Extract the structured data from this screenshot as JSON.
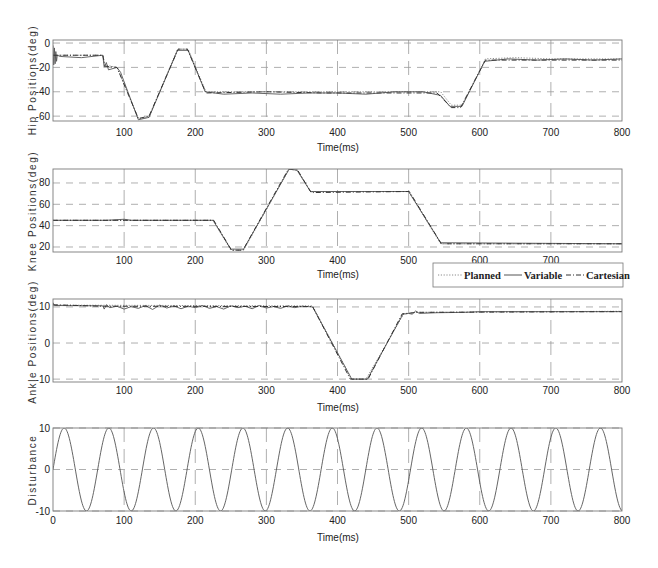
{
  "legend": {
    "entries": [
      {
        "label": "Planned",
        "color": "#8a8a8a",
        "style": "dotted"
      },
      {
        "label": "Variable",
        "color": "#555555",
        "style": "solid"
      },
      {
        "label": "Cartesian",
        "color": "#333333",
        "style": "dashdot"
      }
    ]
  },
  "chart_data": [
    {
      "type": "line",
      "title": "",
      "xlabel": "Time(ms)",
      "ylabel": "Hip Positions(deg)",
      "xlim": [
        0,
        800
      ],
      "ylim": [
        -64,
        2.5
      ],
      "grid": true,
      "xticks": [
        0,
        100,
        200,
        300,
        400,
        500,
        600,
        700,
        800
      ],
      "xtick_labels": [
        "",
        "100",
        "200",
        "300",
        "400",
        "500",
        "600",
        "700",
        "800"
      ],
      "yticks": [
        0,
        -20,
        -40,
        -60
      ],
      "ytick_labels": [
        "0",
        "-20",
        "-40",
        "-60"
      ],
      "series": [
        {
          "name": "Planned",
          "points": [
            [
              0,
              -10
            ],
            [
              70,
              -10
            ],
            [
              73,
              -18
            ],
            [
              90,
              -20
            ],
            [
              120,
              -62
            ],
            [
              135,
              -61
            ],
            [
              175,
              -5
            ],
            [
              190,
              -5
            ],
            [
              215,
              -40
            ],
            [
              545,
              -40
            ],
            [
              560,
              -51
            ],
            [
              575,
              -51
            ],
            [
              608,
              -13
            ],
            [
              650,
              -12
            ],
            [
              700,
              -13
            ],
            [
              800,
              -13
            ]
          ]
        },
        {
          "name": "Variable",
          "points": [
            [
              0,
              -2
            ],
            [
              1,
              -18
            ],
            [
              2,
              -4
            ],
            [
              3,
              -17
            ],
            [
              4,
              -7
            ],
            [
              5,
              -15
            ],
            [
              6,
              -10
            ],
            [
              10,
              -11
            ],
            [
              40,
              -12
            ],
            [
              70,
              -10
            ],
            [
              72,
              -20
            ],
            [
              75,
              -16
            ],
            [
              78,
              -22
            ],
            [
              90,
              -20
            ],
            [
              95,
              -24
            ],
            [
              120,
              -63
            ],
            [
              135,
              -61
            ],
            [
              175,
              -6
            ],
            [
              190,
              -6
            ],
            [
              214,
              -40
            ],
            [
              240,
              -42
            ],
            [
              280,
              -41
            ],
            [
              320,
              -42
            ],
            [
              360,
              -41
            ],
            [
              400,
              -41
            ],
            [
              440,
              -42
            ],
            [
              480,
              -40
            ],
            [
              520,
              -40
            ],
            [
              545,
              -43
            ],
            [
              558,
              -52
            ],
            [
              575,
              -52
            ],
            [
              607,
              -15
            ],
            [
              640,
              -13
            ],
            [
              680,
              -14
            ],
            [
              720,
              -13
            ],
            [
              760,
              -14
            ],
            [
              800,
              -13
            ]
          ]
        },
        {
          "name": "Cartesian",
          "points": [
            [
              0,
              -10
            ],
            [
              70,
              -10
            ],
            [
              73,
              -19
            ],
            [
              90,
              -20
            ],
            [
              120,
              -62
            ],
            [
              135,
              -60
            ],
            [
              176,
              -5
            ],
            [
              189,
              -5
            ],
            [
              215,
              -41
            ],
            [
              300,
              -40
            ],
            [
              380,
              -41
            ],
            [
              460,
              -41
            ],
            [
              540,
              -41
            ],
            [
              560,
              -53
            ],
            [
              573,
              -53
            ],
            [
              608,
              -14
            ],
            [
              800,
              -14
            ]
          ]
        }
      ]
    },
    {
      "type": "line",
      "title": "",
      "xlabel": "Time(ms)",
      "ylabel": "Knee Positions(deg)",
      "xlim": [
        0,
        800
      ],
      "ylim": [
        15.3,
        93.1
      ],
      "grid": true,
      "xticks": [
        0,
        100,
        200,
        300,
        400,
        500,
        600,
        700,
        800
      ],
      "xtick_labels": [
        "",
        "100",
        "200",
        "300",
        "400",
        "500",
        "600",
        "700",
        ""
      ],
      "yticks": [
        20,
        40,
        60,
        80
      ],
      "ytick_labels": [
        "20",
        "40",
        "60",
        "80"
      ],
      "series": [
        {
          "name": "Planned",
          "points": [
            [
              0,
              45
            ],
            [
              225,
              45
            ],
            [
              250,
              17
            ],
            [
              268,
              17
            ],
            [
              332,
              93
            ],
            [
              343,
              93
            ],
            [
              362,
              72
            ],
            [
              500,
              72
            ],
            [
              545,
              23
            ],
            [
              800,
              23
            ]
          ]
        },
        {
          "name": "Variable",
          "points": [
            [
              0,
              45
            ],
            [
              75,
              45
            ],
            [
              100,
              46
            ],
            [
              110,
              45
            ],
            [
              225,
              45
            ],
            [
              250,
              18
            ],
            [
              268,
              18
            ],
            [
              332,
              93
            ],
            [
              343,
              92
            ],
            [
              362,
              72
            ],
            [
              500,
              72
            ],
            [
              545,
              24
            ],
            [
              800,
              23
            ]
          ]
        },
        {
          "name": "Cartesian",
          "points": [
            [
              0,
              45
            ],
            [
              226,
              45
            ],
            [
              251,
              17
            ],
            [
              267,
              17
            ],
            [
              331,
              93
            ],
            [
              344,
              92
            ],
            [
              363,
              71
            ],
            [
              501,
              72
            ],
            [
              546,
              23
            ],
            [
              800,
              23
            ]
          ]
        }
      ]
    },
    {
      "type": "line",
      "title": "",
      "xlabel": "Time(ms)",
      "ylabel": "Ankle Positions(deg)",
      "xlim": [
        0,
        800
      ],
      "ylim": [
        -10.8,
        12.2
      ],
      "grid": true,
      "xticks": [
        0,
        100,
        200,
        300,
        400,
        500,
        600,
        700,
        800
      ],
      "xtick_labels": [
        "",
        "100",
        "200",
        "300",
        "400",
        "500",
        "600",
        "700",
        "800"
      ],
      "yticks": [
        10,
        0,
        -10
      ],
      "ytick_labels": [
        "10",
        "0",
        "-10"
      ],
      "series": [
        {
          "name": "Planned",
          "points": [
            [
              0,
              10.5
            ],
            [
              365,
              10.3
            ],
            [
              420,
              -10
            ],
            [
              440,
              -10
            ],
            [
              493,
              8
            ],
            [
              510,
              8.5
            ],
            [
              800,
              8.8
            ]
          ]
        },
        {
          "name": "Variable",
          "points": [
            [
              0,
              11.2
            ],
            [
              2,
              10.4
            ],
            [
              70,
              10.3
            ],
            [
              72,
              9.4
            ],
            [
              75,
              10.6
            ],
            [
              80,
              9.8
            ],
            [
              90,
              10.2
            ],
            [
              100,
              9.4
            ],
            [
              110,
              10.1
            ],
            [
              120,
              9.6
            ],
            [
              130,
              10.4
            ],
            [
              140,
              9.3
            ],
            [
              150,
              10.5
            ],
            [
              160,
              9.7
            ],
            [
              170,
              10.3
            ],
            [
              180,
              9.5
            ],
            [
              190,
              10.2
            ],
            [
              200,
              9.8
            ],
            [
              210,
              10.4
            ],
            [
              220,
              9.6
            ],
            [
              230,
              10.1
            ],
            [
              240,
              9.4
            ],
            [
              250,
              10.3
            ],
            [
              260,
              9.8
            ],
            [
              270,
              10.2
            ],
            [
              280,
              9.5
            ],
            [
              290,
              10.4
            ],
            [
              300,
              9.7
            ],
            [
              310,
              10.1
            ],
            [
              320,
              9.6
            ],
            [
              330,
              10.3
            ],
            [
              340,
              9.8
            ],
            [
              350,
              10.2
            ],
            [
              365,
              10
            ],
            [
              420,
              -10
            ],
            [
              442,
              -10
            ],
            [
              492,
              8
            ],
            [
              500,
              8.2
            ],
            [
              505,
              8
            ],
            [
              510,
              8.9
            ],
            [
              515,
              8.2
            ],
            [
              540,
              8.4
            ],
            [
              580,
              8.5
            ],
            [
              600,
              8.7
            ],
            [
              800,
              8.7
            ]
          ]
        },
        {
          "name": "Cartesian",
          "points": [
            [
              0,
              10.6
            ],
            [
              70,
              10.2
            ],
            [
              365,
              10.1
            ],
            [
              418,
              -10
            ],
            [
              443,
              -10
            ],
            [
              491,
              8.1
            ],
            [
              512,
              8.5
            ],
            [
              800,
              8.7
            ]
          ]
        }
      ]
    },
    {
      "type": "line",
      "title": "",
      "xlabel": "Time(ms)",
      "ylabel": "Disturbance",
      "xlim": [
        0,
        800
      ],
      "ylim": [
        -10,
        10
      ],
      "grid": true,
      "xticks": [
        0,
        100,
        200,
        300,
        400,
        500,
        600,
        700,
        800
      ],
      "xtick_labels": [
        "0",
        "100",
        "200",
        "300",
        "400",
        "500",
        "600",
        "700",
        "800"
      ],
      "yticks": [
        10,
        0,
        -10
      ],
      "ytick_labels": [
        "10",
        "0",
        "-10"
      ],
      "series": [
        {
          "name": "Disturbance",
          "formula": {
            "kind": "sine",
            "amplitude": 10,
            "angular_frequency_per_ms": 0.1,
            "phase": 0
          },
          "peaks_x": [
            15.7,
            78.5,
            141.4,
            204.2,
            267.0,
            329.9,
            392.7,
            455.5,
            518.4,
            581.2,
            644.0,
            706.9,
            769.7
          ],
          "troughs_x": [
            47.1,
            109.9,
            172.8,
            235.6,
            298.5,
            361.3,
            424.1,
            487.0,
            549.8,
            612.6,
            675.4,
            738.3
          ],
          "color": "#555555",
          "style": "solid"
        }
      ]
    }
  ]
}
